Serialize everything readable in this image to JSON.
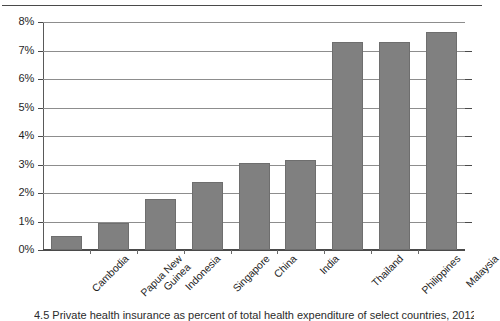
{
  "chart_data": {
    "type": "bar",
    "title": "",
    "xlabel": "",
    "ylabel": "",
    "categories": [
      "Cambodia",
      "Papua New Guinea",
      "Indonesia",
      "Singapore",
      "China",
      "India",
      "Thailand",
      "Philippines",
      "Malaysia"
    ],
    "values": [
      0.5,
      0.95,
      1.8,
      2.4,
      3.05,
      3.15,
      7.3,
      7.3,
      7.65
    ],
    "value_unit": "%",
    "ylim": [
      0,
      8
    ],
    "ytick_values": [
      0,
      1,
      2,
      3,
      4,
      5,
      6,
      7,
      8
    ],
    "ytick_labels": [
      "0%",
      "1%",
      "2%",
      "3%",
      "4%",
      "5%",
      "6%",
      "7%",
      "8%"
    ],
    "grid": true,
    "legend": false,
    "bar_color": "#808080",
    "gridline_color": "#8d8d8d",
    "axis_color": "#4a4a4a",
    "xtick_label_rotation": -45
  },
  "figure": {
    "caption": "4.5 Private health insurance as percent of total health expenditure of select countries, 2012",
    "category_label_lines": [
      [
        "Cambodia"
      ],
      [
        "Papua New",
        "Guinea"
      ],
      [
        "Indonesia"
      ],
      [
        "Singapore"
      ],
      [
        "China"
      ],
      [
        "India"
      ],
      [
        "Thailand"
      ],
      [
        "Philippines"
      ],
      [
        "Malaysia"
      ]
    ]
  }
}
